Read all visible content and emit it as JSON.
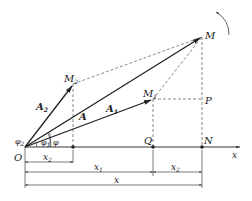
{
  "diagram": {
    "points": {
      "O": "O",
      "M": "M",
      "M1": {
        "base": "M",
        "sub": "1"
      },
      "M2": {
        "base": "M",
        "sub": "2"
      },
      "P": "P",
      "Q": "Q",
      "N": "N"
    },
    "vectors": {
      "A": "A",
      "A1": {
        "base": "A",
        "sub": "1"
      },
      "A2": {
        "base": "A",
        "sub": "2"
      }
    },
    "angles": {
      "phi": "φ",
      "phi1": {
        "base": "φ",
        "sub": "1"
      },
      "phi2": {
        "base": "φ",
        "sub": "2"
      }
    },
    "axis_label": "x",
    "dimensions": {
      "x": "x",
      "x1": {
        "base": "x",
        "sub": "1"
      },
      "x2_left": {
        "base": "x",
        "sub": "2"
      },
      "x2_right": {
        "base": "x",
        "sub": "2"
      }
    },
    "rotation_arrow": "counterclockwise-rotation-icon",
    "colors": {
      "line": "#222222",
      "dashed": "#555555"
    }
  }
}
